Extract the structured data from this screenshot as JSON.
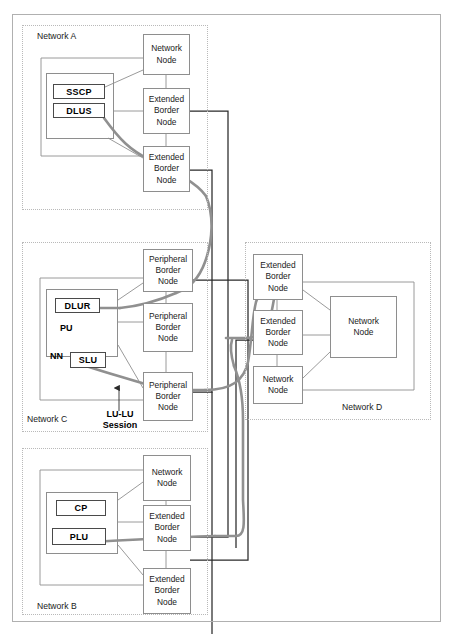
{
  "diagram": {
    "colors": {
      "node_border": "#8e8e8e",
      "tag_border": "#4a4a4a",
      "cloud_border": "#b9b9b9",
      "thin_link": "#8e8e8e",
      "black_link": "#2a2a2a",
      "thick_session": "#909090",
      "frame": "#b0b0b0",
      "background": "#ffffff"
    },
    "clouds": [
      {
        "id": "net-a",
        "label": "Network A"
      },
      {
        "id": "net-c",
        "label": "Network C"
      },
      {
        "id": "net-d",
        "label": "Network D"
      },
      {
        "id": "net-b",
        "label": "Network B"
      }
    ],
    "network_a": {
      "label": "Network A",
      "nodes": [
        {
          "id": "a-nn",
          "lines": [
            "Network",
            "Node"
          ]
        },
        {
          "id": "a-ebn1",
          "lines": [
            "Extended",
            "Border",
            "Node"
          ]
        },
        {
          "id": "a-ebn2",
          "lines": [
            "Extended",
            "Border",
            "Node"
          ]
        }
      ],
      "tags": [
        {
          "id": "a-sscp",
          "label": "SSCP"
        },
        {
          "id": "a-dlus",
          "label": "DLUS"
        }
      ]
    },
    "network_c": {
      "label": "Network C",
      "nodes": [
        {
          "id": "c-pbn1",
          "lines": [
            "Peripheral",
            "Border",
            "Node"
          ]
        },
        {
          "id": "c-pbn2",
          "lines": [
            "Peripheral",
            "Border",
            "Node"
          ]
        },
        {
          "id": "c-pbn3",
          "lines": [
            "Peripheral",
            "Border",
            "Node"
          ]
        }
      ],
      "tags": [
        {
          "id": "c-dlur",
          "label": "DLUR"
        },
        {
          "id": "c-slu",
          "label": "SLU"
        }
      ],
      "text_labels": [
        {
          "id": "c-pu",
          "label": "PU"
        },
        {
          "id": "c-nn",
          "label": "NN"
        }
      ],
      "annotation": {
        "id": "lu-lu-session",
        "line1": "LU-LU",
        "line2": "Session",
        "arrow": "up-arrow"
      }
    },
    "network_d": {
      "label": "Network D",
      "nodes": [
        {
          "id": "d-ebn1",
          "lines": [
            "Extended",
            "Border",
            "Node"
          ]
        },
        {
          "id": "d-ebn2",
          "lines": [
            "Extended",
            "Border",
            "Node"
          ]
        },
        {
          "id": "d-nn1",
          "lines": [
            "Network",
            "Node"
          ]
        },
        {
          "id": "d-nn2",
          "lines": [
            "Network",
            "Node"
          ]
        }
      ]
    },
    "network_b": {
      "label": "Network B",
      "nodes": [
        {
          "id": "b-nn",
          "lines": [
            "Network",
            "Node"
          ]
        },
        {
          "id": "b-ebn1",
          "lines": [
            "Extended",
            "Border",
            "Node"
          ]
        },
        {
          "id": "b-ebn2",
          "lines": [
            "Extended",
            "Border",
            "Node"
          ]
        }
      ],
      "tags": [
        {
          "id": "b-cp",
          "label": "CP"
        },
        {
          "id": "b-plu",
          "label": "PLU"
        }
      ]
    }
  }
}
